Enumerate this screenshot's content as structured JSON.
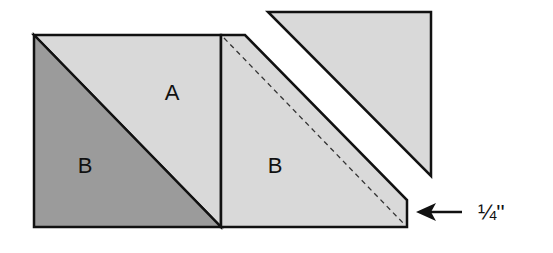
{
  "diagram": {
    "type": "quilt-piecing-diagram",
    "colors": {
      "light_fabric": "#d9d9d9",
      "dark_fabric": "#9b9b9b",
      "outline": "#111111",
      "background": "#ffffff"
    },
    "pieces": {
      "left_square_top_triangle_label": "A",
      "left_square_bottom_triangle_label": "B",
      "right_trimmed_piece_label": "B"
    },
    "annotations": {
      "seam_allowance": "¼''",
      "arrow_direction": "left"
    }
  }
}
